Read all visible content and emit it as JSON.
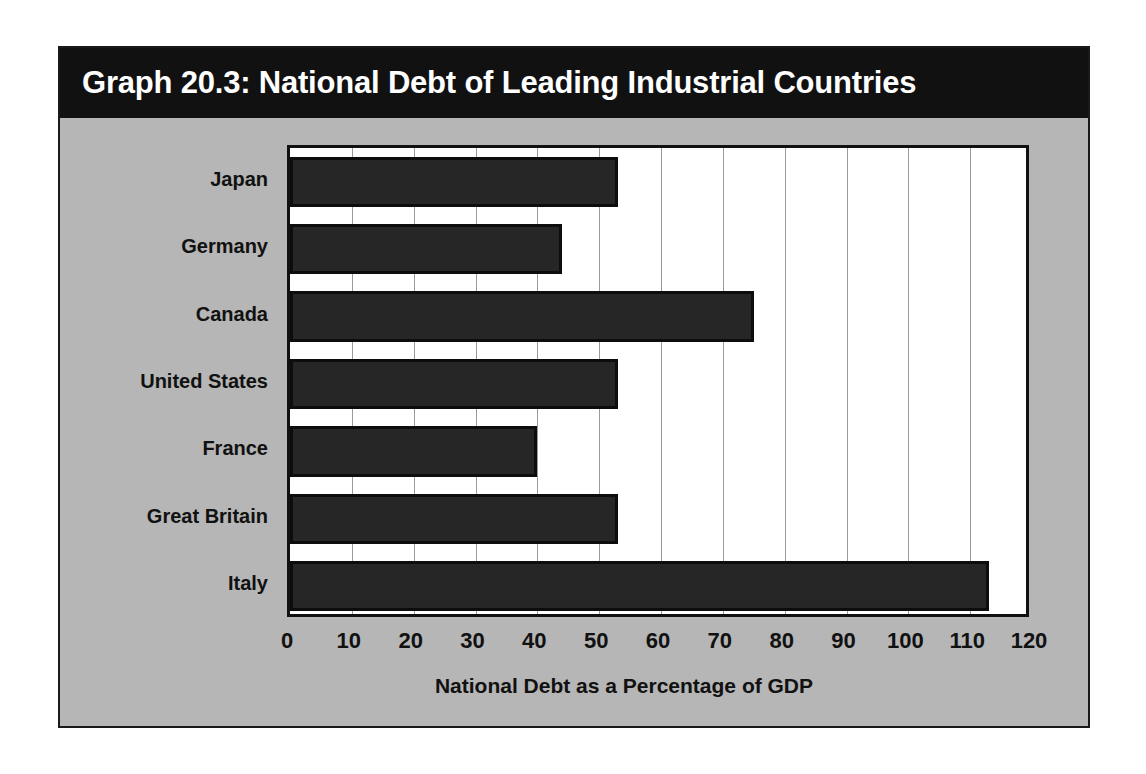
{
  "figure": {
    "title": "Graph 20.3: National Debt of Leading Industrial Countries",
    "background_color": "#b6b6b6",
    "title_bar_color": "#111111",
    "title_text_color": "#ffffff",
    "bar_color": "#262626",
    "plot_background": "#ffffff",
    "gridline_color": "#9a9a9a"
  },
  "chart_data": {
    "type": "bar",
    "orientation": "horizontal",
    "title": "Graph 20.3: National Debt of Leading Industrial Countries",
    "categories": [
      "Japan",
      "Germany",
      "Canada",
      "United States",
      "France",
      "Great Britain",
      "Italy"
    ],
    "values": [
      53,
      44,
      75,
      53,
      40,
      53,
      113
    ],
    "xlabel": "National Debt as a Percentage of GDP",
    "ylabel": "",
    "xlim": [
      0,
      120
    ],
    "xticks": [
      0,
      10,
      20,
      30,
      40,
      50,
      60,
      70,
      80,
      90,
      100,
      110,
      120
    ],
    "xtick_labels": [
      "0",
      "10",
      "20",
      "30",
      "40",
      "50",
      "60",
      "70",
      "80",
      "90",
      "100",
      "110",
      "120"
    ],
    "grid": "vertical",
    "legend": "none",
    "series": [
      {
        "name": "National Debt as a Percentage of GDP",
        "points": [
          {
            "category": "Japan",
            "value": 53
          },
          {
            "category": "Germany",
            "value": 44
          },
          {
            "category": "Canada",
            "value": 75
          },
          {
            "category": "United States",
            "value": 53
          },
          {
            "category": "France",
            "value": 40
          },
          {
            "category": "Great Britain",
            "value": 53
          },
          {
            "category": "Italy",
            "value": 113
          }
        ]
      }
    ]
  }
}
